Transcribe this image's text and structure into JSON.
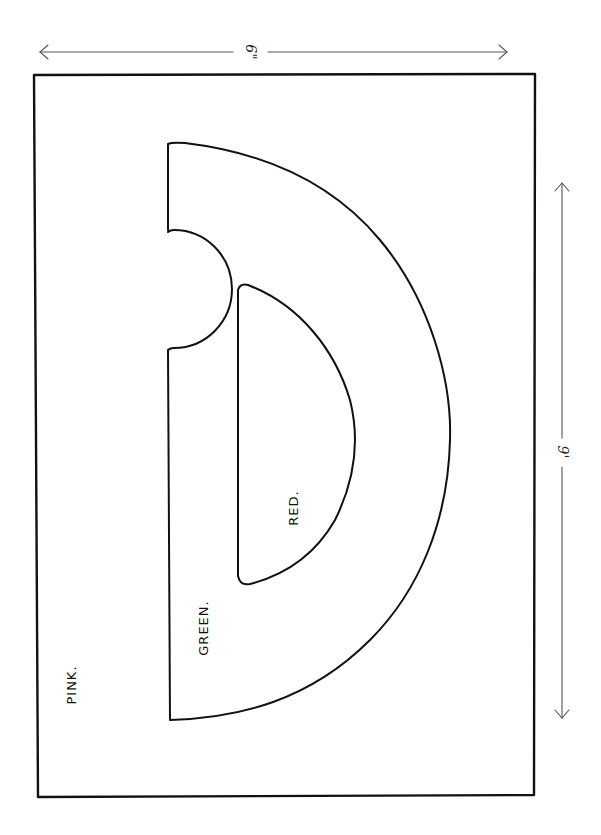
{
  "diagram": {
    "dimensions": {
      "width_label": "6\"",
      "length_label": "9'"
    },
    "regions": [
      {
        "name": "field",
        "label": "PINK."
      },
      {
        "name": "outer-crescent",
        "label": "GREEN."
      },
      {
        "name": "inner-half-disc",
        "label": "RED."
      }
    ],
    "colors": {
      "ink": "#111111",
      "background": "#ffffff"
    }
  }
}
